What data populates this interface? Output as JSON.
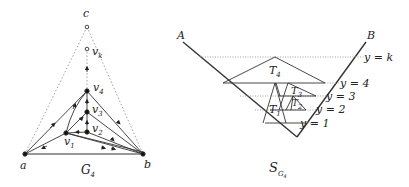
{
  "left_figure": {
    "caption": "G",
    "caption_sub": "4",
    "vertices": {
      "c": "c",
      "vk": "v",
      "vk_sub": "k",
      "v4": "v",
      "v4_sub": "4",
      "v3": "v",
      "v3_sub": "3",
      "v2": "v",
      "v2_sub": "2",
      "v1": "v",
      "v1_sub": "1",
      "a": "a",
      "b": "b"
    }
  },
  "right_figure": {
    "caption": "S",
    "caption_sub": "G",
    "caption_subsub": "4",
    "corner_left": "A",
    "corner_right": "B",
    "levels": [
      "y = k",
      "y = 4",
      "y = 3",
      "y = 2",
      "y = 1"
    ],
    "triangles": [
      {
        "label": "T",
        "sub": "4"
      },
      {
        "label": "T",
        "sub": "3"
      },
      {
        "label": "T",
        "sub": "2"
      },
      {
        "label": "T",
        "sub": "1"
      }
    ]
  },
  "colors": {
    "line": "#333333",
    "dotted": "#888888"
  }
}
